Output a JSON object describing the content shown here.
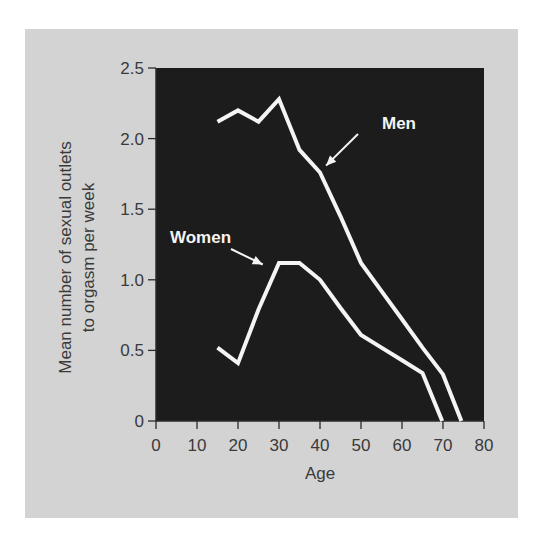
{
  "chart_data": {
    "type": "line",
    "title": "",
    "xlabel": "Age",
    "ylabel": [
      "Mean number of sexual outlets",
      "to orgasm per week"
    ],
    "xlim": [
      0,
      80
    ],
    "ylim": [
      0,
      2.5
    ],
    "x_ticks": [
      0,
      10,
      20,
      30,
      40,
      50,
      60,
      70,
      80
    ],
    "x_tick_labels": [
      "0",
      "10",
      "20",
      "30",
      "40",
      "50",
      "60",
      "70",
      "80"
    ],
    "y_ticks": [
      0,
      0.5,
      1.0,
      1.5,
      2.0,
      2.5
    ],
    "y_tick_labels": [
      "0",
      "0.5",
      "1.0",
      "1.5",
      "2.0",
      "2.5"
    ],
    "grid": false,
    "legend": "inline annotations with arrows",
    "series": [
      {
        "name": "Men",
        "x": [
          15,
          20,
          25,
          30,
          35,
          40,
          45,
          50,
          55,
          60,
          65,
          70,
          74.5
        ],
        "values": [
          2.12,
          2.2,
          2.12,
          2.28,
          1.92,
          1.76,
          1.45,
          1.12,
          0.92,
          0.72,
          0.52,
          0.33,
          0
        ]
      },
      {
        "name": "Women",
        "x": [
          15,
          20,
          25,
          30,
          35,
          40,
          45,
          50,
          55,
          60,
          65,
          69.8
        ],
        "values": [
          0.52,
          0.41,
          0.79,
          1.12,
          1.12,
          1.0,
          0.8,
          0.61,
          0.52,
          0.43,
          0.34,
          0
        ]
      }
    ],
    "annotations": [
      {
        "text": "Men",
        "arrow_to": [
          40,
          1.78
        ]
      },
      {
        "text": "Women",
        "arrow_to": [
          27.5,
          1.08
        ]
      }
    ]
  },
  "colors": {
    "figure_background": "#d3d3d3",
    "plot_background": "#1c1c1c",
    "line": "#f4f4f4",
    "text": "#3a3a3a",
    "axis": "#2a2a2a"
  }
}
